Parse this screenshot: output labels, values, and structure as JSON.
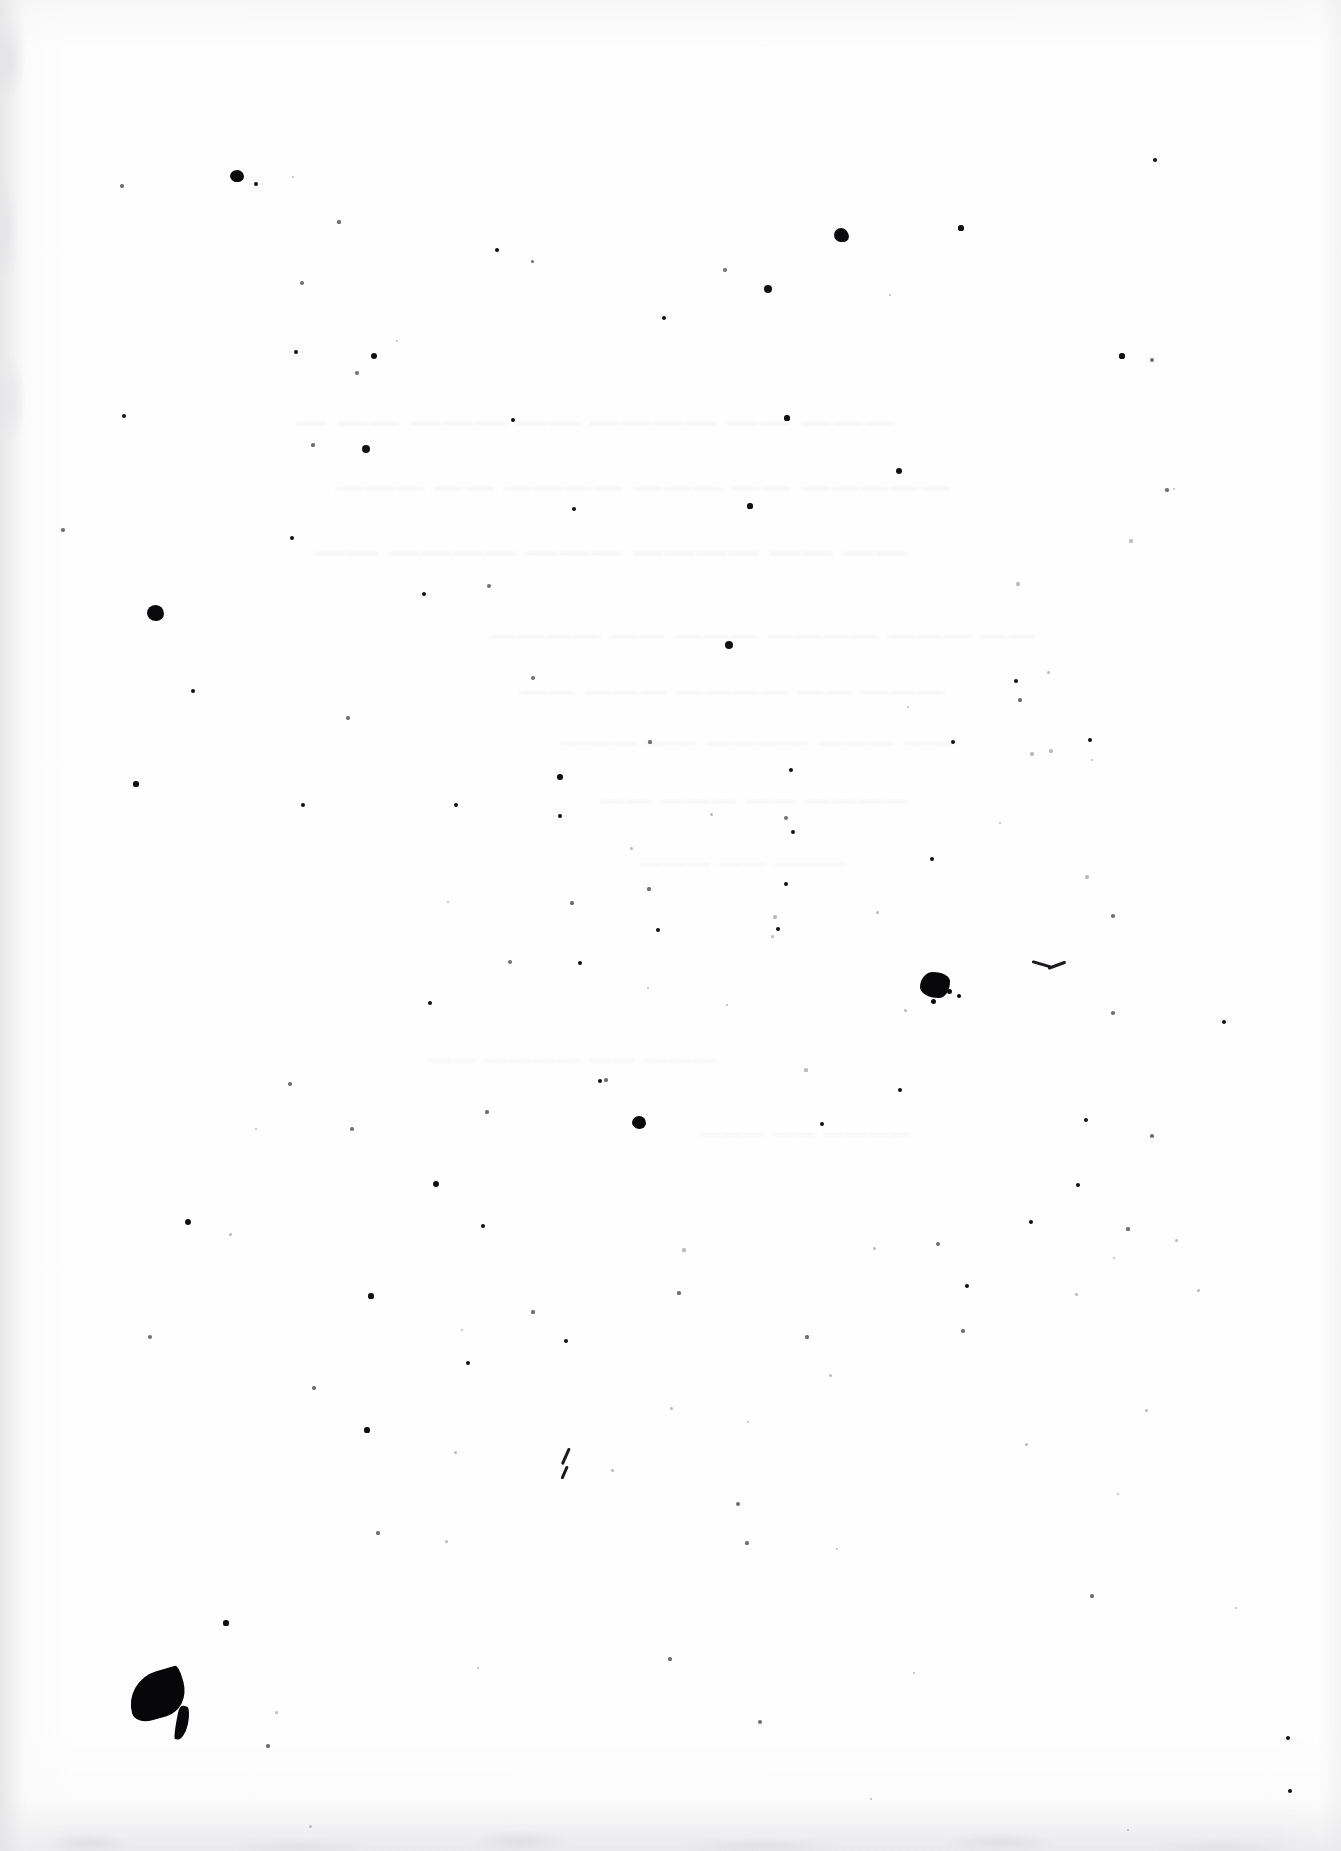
{
  "document": {
    "kind": "scanned-page",
    "description": "Overexposed scan of a blank-looking page; original print washed out to faint bleed-through, with scanner dust specks and ink blots",
    "page_width": 1341,
    "page_height": 1851,
    "paper_color": "#fefefe",
    "ink_color": "#0a0a0c",
    "edge_shadow_color": "#e4e4e6",
    "ghost_text_color": "#bdbdc2"
  },
  "ghost_text": {
    "legible": false,
    "note": "bleed-through too faint to transcribe",
    "lines": [
      {
        "text": "— —— ——— —— ———— —— ———",
        "x": 296,
        "y": 404,
        "size": 30
      },
      {
        "text": "——— —— ———— ——— —— —————",
        "x": 336,
        "y": 470,
        "size": 28
      },
      {
        "text": "—— ———— ——— ———— —— ——",
        "x": 316,
        "y": 534,
        "size": 30
      },
      {
        "text": "———— —— ——— ———— ——— ——",
        "x": 490,
        "y": 620,
        "size": 26
      },
      {
        "text": "—— ——— ———— —— ———",
        "x": 520,
        "y": 676,
        "size": 26
      },
      {
        "text": "——— —— ———— ——— ——",
        "x": 560,
        "y": 728,
        "size": 24
      },
      {
        "text": "—— ——— —— ————",
        "x": 600,
        "y": 786,
        "size": 24
      },
      {
        "text": "——— —— ———",
        "x": 640,
        "y": 850,
        "size": 22
      },
      {
        "text": "—— ———— —— ———",
        "x": 430,
        "y": 1046,
        "size": 22
      },
      {
        "text": "——— —— ————",
        "x": 700,
        "y": 1122,
        "size": 20
      }
    ]
  },
  "blots": [
    {
      "name": "ink-blot-crescent-bottom-left",
      "x": 128,
      "y": 1672,
      "w": 58,
      "h": 46,
      "shape": "crescent"
    },
    {
      "name": "ink-blot-splatter-right-mid",
      "x": 920,
      "y": 972,
      "w": 30,
      "h": 26,
      "shape": "splatter"
    },
    {
      "name": "ink-blot-round-left-upper",
      "x": 147,
      "y": 605,
      "w": 17,
      "h": 16,
      "shape": "round"
    },
    {
      "name": "ink-blot-round-center-lower",
      "x": 632,
      "y": 1116,
      "w": 14,
      "h": 13,
      "shape": "round"
    },
    {
      "name": "ink-blot-round-top-left",
      "x": 230,
      "y": 170,
      "w": 14,
      "h": 12,
      "shape": "round"
    },
    {
      "name": "ink-blot-round-top-right",
      "x": 836,
      "y": 230,
      "w": 13,
      "h": 12,
      "shape": "round"
    }
  ],
  "pen_marks": [
    {
      "name": "pen-mark-v-tick",
      "x": 1032,
      "y": 958,
      "w": 34,
      "h": 16,
      "shape": "shallow-v"
    },
    {
      "name": "pen-mark-diagonal-short",
      "x": 568,
      "y": 1448,
      "w": 10,
      "h": 18,
      "shape": "diagonal"
    },
    {
      "name": "pen-mark-diagonal-lower",
      "x": 566,
      "y": 1466,
      "w": 8,
      "h": 14,
      "shape": "diagonal"
    }
  ],
  "specks": {
    "note": "scanner dust and toner specks; x,y = center px, r = radius px, t = tone",
    "items": [
      {
        "x": 236,
        "y": 176,
        "r": 5.5,
        "t": "dark"
      },
      {
        "x": 256,
        "y": 184,
        "r": 2.0,
        "t": "dark"
      },
      {
        "x": 122,
        "y": 186,
        "r": 1.8,
        "t": "soft"
      },
      {
        "x": 293,
        "y": 177,
        "r": 1.2,
        "t": "faint"
      },
      {
        "x": 1155,
        "y": 160,
        "r": 2.2,
        "t": "dark"
      },
      {
        "x": 339,
        "y": 222,
        "r": 1.6,
        "t": "soft"
      },
      {
        "x": 497,
        "y": 250,
        "r": 2.2,
        "t": "dark"
      },
      {
        "x": 532,
        "y": 261,
        "r": 1.5,
        "t": "soft"
      },
      {
        "x": 841,
        "y": 235,
        "r": 7.0,
        "t": "dark"
      },
      {
        "x": 961,
        "y": 228,
        "r": 2.6,
        "t": "dark"
      },
      {
        "x": 725,
        "y": 270,
        "r": 1.9,
        "t": "soft"
      },
      {
        "x": 302,
        "y": 283,
        "r": 2.0,
        "t": "soft"
      },
      {
        "x": 890,
        "y": 295,
        "r": 1.4,
        "t": "faint"
      },
      {
        "x": 768,
        "y": 289,
        "r": 4.2,
        "t": "dark"
      },
      {
        "x": 664,
        "y": 318,
        "r": 2.2,
        "t": "dark"
      },
      {
        "x": 296,
        "y": 352,
        "r": 2.4,
        "t": "dark"
      },
      {
        "x": 374,
        "y": 356,
        "r": 3.0,
        "t": "dark"
      },
      {
        "x": 397,
        "y": 341,
        "r": 1.4,
        "t": "faint"
      },
      {
        "x": 1122,
        "y": 356,
        "r": 2.6,
        "t": "dark"
      },
      {
        "x": 1152,
        "y": 360,
        "r": 2.0,
        "t": "soft"
      },
      {
        "x": 357,
        "y": 373,
        "r": 2.0,
        "t": "soft"
      },
      {
        "x": 124,
        "y": 416,
        "r": 2.2,
        "t": "dark"
      },
      {
        "x": 513,
        "y": 420,
        "r": 2.4,
        "t": "dark"
      },
      {
        "x": 787,
        "y": 418,
        "r": 2.6,
        "t": "dark"
      },
      {
        "x": 313,
        "y": 445,
        "r": 1.6,
        "t": "soft"
      },
      {
        "x": 366,
        "y": 449,
        "r": 4.0,
        "t": "dark"
      },
      {
        "x": 899,
        "y": 471,
        "r": 3.0,
        "t": "dark"
      },
      {
        "x": 1167,
        "y": 490,
        "r": 1.8,
        "t": "soft"
      },
      {
        "x": 750,
        "y": 506,
        "r": 2.6,
        "t": "dark"
      },
      {
        "x": 574,
        "y": 509,
        "r": 2.2,
        "t": "dark"
      },
      {
        "x": 1174,
        "y": 489,
        "r": 1.3,
        "t": "faint"
      },
      {
        "x": 63,
        "y": 530,
        "r": 1.8,
        "t": "soft"
      },
      {
        "x": 292,
        "y": 538,
        "r": 2.2,
        "t": "dark"
      },
      {
        "x": 489,
        "y": 586,
        "r": 2.0,
        "t": "soft"
      },
      {
        "x": 1131,
        "y": 541,
        "r": 1.7,
        "t": "faint"
      },
      {
        "x": 424,
        "y": 594,
        "r": 2.2,
        "t": "dark"
      },
      {
        "x": 1018,
        "y": 584,
        "r": 1.6,
        "t": "faint"
      },
      {
        "x": 729,
        "y": 645,
        "r": 4.0,
        "t": "dark"
      },
      {
        "x": 193,
        "y": 691,
        "r": 2.4,
        "t": "dark"
      },
      {
        "x": 533,
        "y": 678,
        "r": 2.0,
        "t": "soft"
      },
      {
        "x": 1016,
        "y": 681,
        "r": 2.0,
        "t": "dark"
      },
      {
        "x": 1048,
        "y": 672,
        "r": 1.5,
        "t": "faint"
      },
      {
        "x": 1020,
        "y": 700,
        "r": 1.6,
        "t": "soft"
      },
      {
        "x": 908,
        "y": 707,
        "r": 1.4,
        "t": "faint"
      },
      {
        "x": 348,
        "y": 718,
        "r": 1.8,
        "t": "soft"
      },
      {
        "x": 650,
        "y": 742,
        "r": 1.6,
        "t": "soft"
      },
      {
        "x": 1090,
        "y": 740,
        "r": 2.4,
        "t": "dark"
      },
      {
        "x": 953,
        "y": 742,
        "r": 2.0,
        "t": "dark"
      },
      {
        "x": 560,
        "y": 777,
        "r": 2.8,
        "t": "dark"
      },
      {
        "x": 791,
        "y": 770,
        "r": 2.4,
        "t": "dark"
      },
      {
        "x": 136,
        "y": 784,
        "r": 2.6,
        "t": "dark"
      },
      {
        "x": 303,
        "y": 805,
        "r": 2.2,
        "t": "dark"
      },
      {
        "x": 1032,
        "y": 754,
        "r": 1.6,
        "t": "faint"
      },
      {
        "x": 1092,
        "y": 760,
        "r": 1.3,
        "t": "faint"
      },
      {
        "x": 456,
        "y": 805,
        "r": 2.0,
        "t": "dark"
      },
      {
        "x": 786,
        "y": 818,
        "r": 1.9,
        "t": "soft"
      },
      {
        "x": 560,
        "y": 816,
        "r": 2.2,
        "t": "dark"
      },
      {
        "x": 1051,
        "y": 751,
        "r": 1.6,
        "t": "faint"
      },
      {
        "x": 711,
        "y": 814,
        "r": 1.5,
        "t": "faint"
      },
      {
        "x": 1000,
        "y": 823,
        "r": 1.4,
        "t": "faint"
      },
      {
        "x": 793,
        "y": 832,
        "r": 2.0,
        "t": "dark"
      },
      {
        "x": 631,
        "y": 848,
        "r": 1.5,
        "t": "faint"
      },
      {
        "x": 932,
        "y": 859,
        "r": 2.2,
        "t": "dark"
      },
      {
        "x": 1087,
        "y": 877,
        "r": 1.6,
        "t": "faint"
      },
      {
        "x": 786,
        "y": 884,
        "r": 2.0,
        "t": "dark"
      },
      {
        "x": 649,
        "y": 889,
        "r": 1.6,
        "t": "soft"
      },
      {
        "x": 448,
        "y": 902,
        "r": 1.4,
        "t": "faint"
      },
      {
        "x": 658,
        "y": 930,
        "r": 2.4,
        "t": "dark"
      },
      {
        "x": 775,
        "y": 917,
        "r": 1.6,
        "t": "faint"
      },
      {
        "x": 877,
        "y": 912,
        "r": 1.5,
        "t": "faint"
      },
      {
        "x": 572,
        "y": 903,
        "r": 1.6,
        "t": "soft"
      },
      {
        "x": 772,
        "y": 936,
        "r": 1.5,
        "t": "faint"
      },
      {
        "x": 1113,
        "y": 916,
        "r": 1.7,
        "t": "soft"
      },
      {
        "x": 510,
        "y": 962,
        "r": 2.0,
        "t": "soft"
      },
      {
        "x": 580,
        "y": 963,
        "r": 2.2,
        "t": "dark"
      },
      {
        "x": 778,
        "y": 929,
        "r": 2.0,
        "t": "dark"
      },
      {
        "x": 430,
        "y": 1003,
        "r": 2.4,
        "t": "dark"
      },
      {
        "x": 1113,
        "y": 1013,
        "r": 1.8,
        "t": "soft"
      },
      {
        "x": 648,
        "y": 988,
        "r": 1.4,
        "t": "faint"
      },
      {
        "x": 905,
        "y": 1010,
        "r": 1.5,
        "t": "faint"
      },
      {
        "x": 1224,
        "y": 1022,
        "r": 2.0,
        "t": "dark"
      },
      {
        "x": 606,
        "y": 1080,
        "r": 1.6,
        "t": "soft"
      },
      {
        "x": 727,
        "y": 1005,
        "r": 1.4,
        "t": "faint"
      },
      {
        "x": 1400,
        "y": 1000,
        "r": 1.2,
        "t": "faint"
      },
      {
        "x": 600,
        "y": 1081,
        "r": 2.0,
        "t": "dark"
      },
      {
        "x": 900,
        "y": 1090,
        "r": 2.2,
        "t": "dark"
      },
      {
        "x": 290,
        "y": 1084,
        "r": 1.8,
        "t": "soft"
      },
      {
        "x": 1086,
        "y": 1120,
        "r": 2.2,
        "t": "dark"
      },
      {
        "x": 806,
        "y": 1070,
        "r": 1.6,
        "t": "faint"
      },
      {
        "x": 487,
        "y": 1112,
        "r": 1.6,
        "t": "soft"
      },
      {
        "x": 256,
        "y": 1129,
        "r": 1.4,
        "t": "faint"
      },
      {
        "x": 1152,
        "y": 1136,
        "r": 1.8,
        "t": "soft"
      },
      {
        "x": 352,
        "y": 1129,
        "r": 2.0,
        "t": "soft"
      },
      {
        "x": 822,
        "y": 1124,
        "r": 2.4,
        "t": "dark"
      },
      {
        "x": 436,
        "y": 1184,
        "r": 3.0,
        "t": "dark"
      },
      {
        "x": 1078,
        "y": 1185,
        "r": 2.2,
        "t": "dark"
      },
      {
        "x": 188,
        "y": 1222,
        "r": 3.2,
        "t": "dark"
      },
      {
        "x": 230,
        "y": 1234,
        "r": 1.5,
        "t": "faint"
      },
      {
        "x": 483,
        "y": 1226,
        "r": 2.2,
        "t": "dark"
      },
      {
        "x": 684,
        "y": 1250,
        "r": 1.6,
        "t": "faint"
      },
      {
        "x": 1128,
        "y": 1229,
        "r": 1.6,
        "t": "soft"
      },
      {
        "x": 1031,
        "y": 1222,
        "r": 2.0,
        "t": "dark"
      },
      {
        "x": 938,
        "y": 1244,
        "r": 2.0,
        "t": "soft"
      },
      {
        "x": 874,
        "y": 1248,
        "r": 1.5,
        "t": "faint"
      },
      {
        "x": 1114,
        "y": 1258,
        "r": 1.4,
        "t": "faint"
      },
      {
        "x": 1176,
        "y": 1240,
        "r": 1.5,
        "t": "faint"
      },
      {
        "x": 679,
        "y": 1293,
        "r": 1.6,
        "t": "soft"
      },
      {
        "x": 967,
        "y": 1286,
        "r": 2.2,
        "t": "dark"
      },
      {
        "x": 371,
        "y": 1296,
        "r": 2.6,
        "t": "dark"
      },
      {
        "x": 1198,
        "y": 1290,
        "r": 1.5,
        "t": "faint"
      },
      {
        "x": 533,
        "y": 1312,
        "r": 1.6,
        "t": "soft"
      },
      {
        "x": 1076,
        "y": 1294,
        "r": 1.5,
        "t": "faint"
      },
      {
        "x": 462,
        "y": 1330,
        "r": 1.4,
        "t": "faint"
      },
      {
        "x": 150,
        "y": 1337,
        "r": 2.0,
        "t": "soft"
      },
      {
        "x": 566,
        "y": 1341,
        "r": 2.0,
        "t": "dark"
      },
      {
        "x": 468,
        "y": 1363,
        "r": 2.2,
        "t": "dark"
      },
      {
        "x": 807,
        "y": 1337,
        "r": 1.6,
        "t": "soft"
      },
      {
        "x": 963,
        "y": 1331,
        "r": 1.7,
        "t": "soft"
      },
      {
        "x": 314,
        "y": 1388,
        "r": 1.7,
        "t": "soft"
      },
      {
        "x": 830,
        "y": 1375,
        "r": 1.5,
        "t": "faint"
      },
      {
        "x": 671,
        "y": 1408,
        "r": 1.5,
        "t": "faint"
      },
      {
        "x": 1146,
        "y": 1410,
        "r": 1.5,
        "t": "faint"
      },
      {
        "x": 367,
        "y": 1430,
        "r": 2.6,
        "t": "dark"
      },
      {
        "x": 1026,
        "y": 1444,
        "r": 1.5,
        "t": "faint"
      },
      {
        "x": 455,
        "y": 1452,
        "r": 1.5,
        "t": "faint"
      },
      {
        "x": 748,
        "y": 1422,
        "r": 1.4,
        "t": "faint"
      },
      {
        "x": 612,
        "y": 1470,
        "r": 1.5,
        "t": "faint"
      },
      {
        "x": 1118,
        "y": 1494,
        "r": 1.4,
        "t": "faint"
      },
      {
        "x": 738,
        "y": 1504,
        "r": 2.0,
        "t": "soft"
      },
      {
        "x": 378,
        "y": 1533,
        "r": 1.6,
        "t": "soft"
      },
      {
        "x": 446,
        "y": 1541,
        "r": 1.5,
        "t": "faint"
      },
      {
        "x": 747,
        "y": 1543,
        "r": 1.6,
        "t": "soft"
      },
      {
        "x": 837,
        "y": 1549,
        "r": 1.4,
        "t": "faint"
      },
      {
        "x": 1092,
        "y": 1596,
        "r": 1.6,
        "t": "soft"
      },
      {
        "x": 1236,
        "y": 1608,
        "r": 1.4,
        "t": "faint"
      },
      {
        "x": 226,
        "y": 1623,
        "r": 2.6,
        "t": "dark"
      },
      {
        "x": 670,
        "y": 1659,
        "r": 1.6,
        "t": "soft"
      },
      {
        "x": 478,
        "y": 1668,
        "r": 1.4,
        "t": "faint"
      },
      {
        "x": 914,
        "y": 1673,
        "r": 1.4,
        "t": "faint"
      },
      {
        "x": 276,
        "y": 1712,
        "r": 1.5,
        "t": "faint"
      },
      {
        "x": 760,
        "y": 1722,
        "r": 2.0,
        "t": "soft"
      },
      {
        "x": 1288,
        "y": 1738,
        "r": 2.0,
        "t": "dark"
      },
      {
        "x": 268,
        "y": 1746,
        "r": 1.6,
        "t": "soft"
      },
      {
        "x": 1290,
        "y": 1791,
        "r": 2.4,
        "t": "dark"
      },
      {
        "x": 871,
        "y": 1799,
        "r": 1.4,
        "t": "faint"
      },
      {
        "x": 310,
        "y": 1826,
        "r": 1.5,
        "t": "faint"
      },
      {
        "x": 1128,
        "y": 1830,
        "r": 1.4,
        "t": "faint"
      }
    ]
  }
}
